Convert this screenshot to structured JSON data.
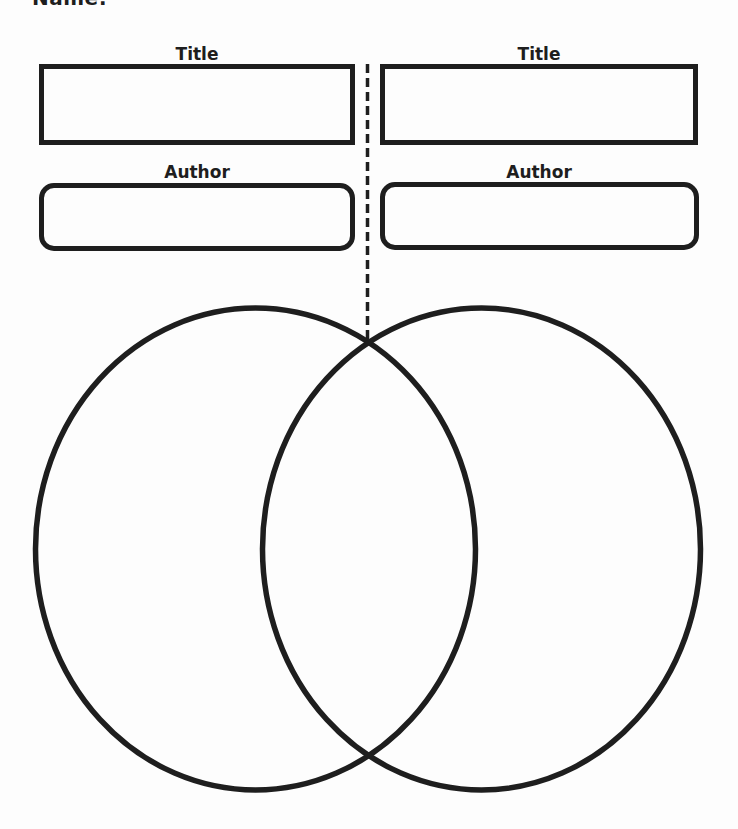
{
  "worksheet": {
    "name_label": "Name:",
    "left": {
      "title_label": "Title",
      "author_label": "Author",
      "title_value": "",
      "author_value": ""
    },
    "right": {
      "title_label": "Title",
      "author_label": "Author",
      "title_value": "",
      "author_value": ""
    },
    "venn": {
      "left_circle_text": "",
      "overlap_text": "",
      "right_circle_text": ""
    },
    "colors": {
      "ink": "#1e1e1e",
      "paper": "#fdfdfd"
    }
  }
}
